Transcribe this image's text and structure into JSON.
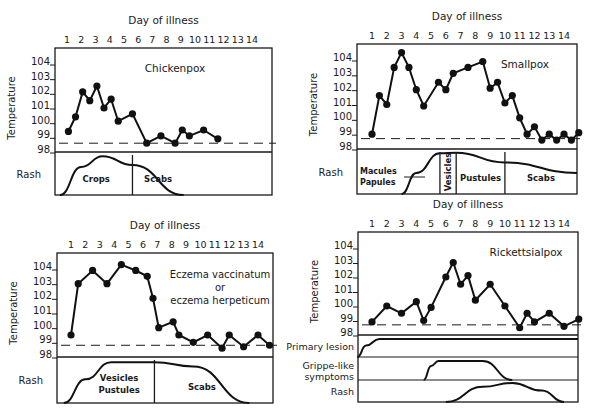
{
  "figure": {
    "caption": ""
  },
  "chart_data": [
    {
      "type": "line",
      "title": "Chickenpox",
      "xlabel": "Day of illness",
      "ylabel": "Temperature",
      "x_ticks": [
        1,
        2,
        3,
        4,
        5,
        6,
        7,
        8,
        9,
        10,
        11,
        12,
        13,
        14
      ],
      "y_ticks": [
        98,
        99,
        100,
        101,
        102,
        103,
        104
      ],
      "ylim": [
        98,
        104.6
      ],
      "baseline": 98.6,
      "points": [
        [
          0.6,
          99.4
        ],
        [
          1.1,
          100.4
        ],
        [
          1.6,
          102.1
        ],
        [
          2.1,
          101.5
        ],
        [
          2.6,
          102.5
        ],
        [
          3.1,
          101.0
        ],
        [
          3.6,
          101.6
        ],
        [
          4.1,
          100.1
        ],
        [
          5.1,
          100.6
        ],
        [
          6.1,
          98.6
        ],
        [
          7.1,
          99.1
        ],
        [
          8.1,
          98.6
        ],
        [
          8.6,
          99.5
        ],
        [
          9.1,
          99.1
        ],
        [
          10.1,
          99.5
        ],
        [
          11.1,
          98.9
        ]
      ],
      "rows": [
        {
          "label": "Rash",
          "phases": [
            {
              "label": "Crops",
              "from": 0.5,
              "to": 5.6
            },
            {
              "label": "Scabs",
              "from": 5.6,
              "to": 9.2
            }
          ],
          "curve": [
            [
              0.5,
              0
            ],
            [
              2,
              0.7
            ],
            [
              3.5,
              0.97
            ],
            [
              5.6,
              0.75
            ],
            [
              9.2,
              0
            ]
          ]
        }
      ],
      "box": {
        "x": 55,
        "y": 48,
        "w": 217,
        "plot_h": 104,
        "row_h": [
          43
        ]
      },
      "day_x": [
        67,
        252
      ]
    },
    {
      "type": "line",
      "title": "Smallpox",
      "xlabel": "Day of illness",
      "ylabel": "Temperature",
      "x_ticks": [
        1,
        2,
        3,
        4,
        5,
        6,
        7,
        8,
        9,
        10,
        11,
        12,
        13,
        14
      ],
      "y_ticks": [
        98,
        99,
        100,
        101,
        102,
        103,
        104
      ],
      "ylim": [
        98,
        104.8
      ],
      "baseline": 98.7,
      "points": [
        [
          0.5,
          99.0
        ],
        [
          1.0,
          101.6
        ],
        [
          1.5,
          101.0
        ],
        [
          2.0,
          103.5
        ],
        [
          2.5,
          104.5
        ],
        [
          3.0,
          103.5
        ],
        [
          3.5,
          102.0
        ],
        [
          4.0,
          100.9
        ],
        [
          5.0,
          102.5
        ],
        [
          5.5,
          102.0
        ],
        [
          6.0,
          103.1
        ],
        [
          7.0,
          103.5
        ],
        [
          8.0,
          103.9
        ],
        [
          8.5,
          102.1
        ],
        [
          9.0,
          102.5
        ],
        [
          9.5,
          101.1
        ],
        [
          10.0,
          101.6
        ],
        [
          10.5,
          100.1
        ],
        [
          11.0,
          99.0
        ],
        [
          11.5,
          99.5
        ],
        [
          12.0,
          98.6
        ],
        [
          12.5,
          99.0
        ],
        [
          13.0,
          98.6
        ],
        [
          13.5,
          99.0
        ],
        [
          14.0,
          98.6
        ],
        [
          14.5,
          99.1
        ]
      ],
      "rows": [
        {
          "label": "Rash",
          "phases": [
            {
              "label": "Macules / Papules",
              "from": 0.8,
              "to": 5.6
            },
            {
              "label": "Vesicles",
              "from": 5.6,
              "to": 6.7
            },
            {
              "label": "Pustules",
              "from": 6.7,
              "to": 10.0
            },
            {
              "label": "Scabs",
              "from": 10.0,
              "to": 15.2
            }
          ],
          "curve": [
            [
              3.0,
              0
            ],
            [
              4.0,
              0.5
            ],
            [
              5.6,
              0.97
            ],
            [
              6.7,
              0.98
            ],
            [
              10.0,
              0.75
            ],
            [
              15.2,
              0.5
            ]
          ]
        }
      ],
      "box": {
        "x": 357,
        "y": 44,
        "w": 220,
        "plot_h": 105,
        "row_h": [
          45
        ]
      },
      "day_x": [
        372,
        564
      ]
    },
    {
      "type": "line",
      "title": "Eczema vaccinatum or eczema herpeticum",
      "xlabel": "Day of illness",
      "ylabel": "Temperature",
      "x_ticks": [
        1,
        2,
        3,
        4,
        5,
        6,
        7,
        8,
        9,
        10,
        11,
        12,
        13,
        14
      ],
      "y_ticks": [
        98,
        99,
        100,
        101,
        102,
        103,
        104
      ],
      "ylim": [
        98,
        104.6
      ],
      "baseline": 98.8,
      "points": [
        [
          0.5,
          99.5
        ],
        [
          1.0,
          103.0
        ],
        [
          2.0,
          103.9
        ],
        [
          3.0,
          103.0
        ],
        [
          4.0,
          104.3
        ],
        [
          5.0,
          103.9
        ],
        [
          5.8,
          103.5
        ],
        [
          6.2,
          102.0
        ],
        [
          6.6,
          100.0
        ],
        [
          7.6,
          100.4
        ],
        [
          8.0,
          99.5
        ],
        [
          9.0,
          99.0
        ],
        [
          10.0,
          99.5
        ],
        [
          11.0,
          98.6
        ],
        [
          11.5,
          99.5
        ],
        [
          12.5,
          98.7
        ],
        [
          13.5,
          99.5
        ],
        [
          14.3,
          98.8
        ]
      ],
      "rows": [
        {
          "label": "Rash",
          "phases": [
            {
              "label": "Vesicles Pustules",
              "from": 0.5,
              "to": 6.8
            },
            {
              "label": "Scabs",
              "from": 6.8,
              "to": 13.4
            }
          ],
          "curve": [
            [
              0.5,
              0
            ],
            [
              2.0,
              0.55
            ],
            [
              3.8,
              0.95
            ],
            [
              6.8,
              0.95
            ],
            [
              9.5,
              0.85
            ],
            [
              13.4,
              0
            ]
          ]
        }
      ],
      "box": {
        "x": 57,
        "y": 253,
        "w": 216,
        "plot_h": 104,
        "row_h": [
          46
        ]
      },
      "day_x": [
        71,
        258
      ]
    },
    {
      "type": "line",
      "title": "Rickettsialpox",
      "xlabel": "Day of illness",
      "ylabel": "Temperature",
      "x_ticks": [
        1,
        2,
        3,
        4,
        5,
        6,
        7,
        8,
        9,
        10,
        11,
        12,
        13,
        14
      ],
      "y_ticks": [
        98,
        99,
        100,
        101,
        102,
        103,
        104
      ],
      "ylim": [
        98,
        104.6
      ],
      "baseline": 98.7,
      "points": [
        [
          0.5,
          98.9
        ],
        [
          1.5,
          100.0
        ],
        [
          2.5,
          99.5
        ],
        [
          3.5,
          100.3
        ],
        [
          4.0,
          99.0
        ],
        [
          4.5,
          99.9
        ],
        [
          5.5,
          102.0
        ],
        [
          6.0,
          103.0
        ],
        [
          6.5,
          101.5
        ],
        [
          7.0,
          102.1
        ],
        [
          7.5,
          100.4
        ],
        [
          8.5,
          101.5
        ],
        [
          9.5,
          100.0
        ],
        [
          10.5,
          98.5
        ],
        [
          11.0,
          99.5
        ],
        [
          11.5,
          98.9
        ],
        [
          12.5,
          99.5
        ],
        [
          13.5,
          98.6
        ],
        [
          14.5,
          99.1
        ]
      ],
      "rows": [
        {
          "label": "Primary lesion",
          "curve": [
            [
              0.0,
              0
            ],
            [
              0.6,
              0.6
            ],
            [
              1.5,
              0.95
            ],
            [
              15.2,
              0.95
            ]
          ]
        },
        {
          "label": "Gripple-like symptoms",
          "curve": [
            [
              4.5,
              0
            ],
            [
              5.0,
              0.7
            ],
            [
              5.5,
              0.95
            ],
            [
              8.5,
              0.95
            ],
            [
              10.5,
              0
            ]
          ]
        },
        {
          "label": "Rash",
          "curve": [
            [
              6.0,
              0
            ],
            [
              8.5,
              0.8
            ],
            [
              10.5,
              1.0
            ],
            [
              12.5,
              0.6
            ],
            [
              14.0,
              0
            ]
          ]
        }
      ],
      "box": {
        "x": 358,
        "y": 232,
        "w": 220,
        "plot_h": 103,
        "row_h": [
          22,
          23,
          22
        ]
      },
      "day_x": [
        372,
        564
      ]
    }
  ],
  "labels": {
    "day_of_illness": "Day of illness",
    "temperature": "Temperature",
    "rash": "Rash",
    "primary_lesion": "Primary lesion",
    "grippe_line1": "Grippe-like",
    "grippe_line2": "symptoms",
    "eczema_line1": "Eczema vaccinatum",
    "eczema_line2": "or",
    "eczema_line3": "eczema herpeticum",
    "macules": "Macules",
    "papules": "Papules"
  }
}
